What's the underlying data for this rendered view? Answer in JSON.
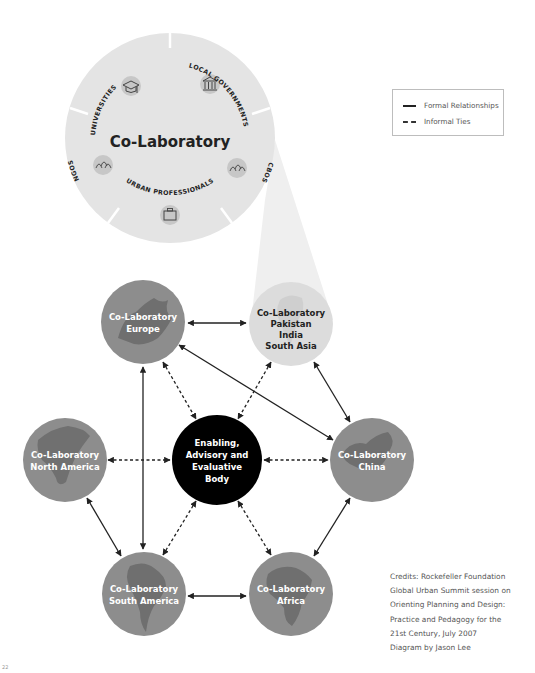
{
  "title": "Co-Laboratory",
  "stakeholders": [
    {
      "label": "UNIVERSITIES",
      "icon": "graduation-cap-icon"
    },
    {
      "label": "LOCAL GOVERNMENTS",
      "icon": "government-building-icon"
    },
    {
      "label": "CBOS",
      "icon": "community-group-icon"
    },
    {
      "label": "URBAN PROFESSIONALS",
      "icon": "briefcase-icon"
    },
    {
      "label": "NGOS",
      "icon": "people-group-icon"
    }
  ],
  "legend": {
    "formal": "Formal Relationships",
    "informal": "Informal Ties"
  },
  "nodes": {
    "europe": {
      "line1": "Co-Laboratory",
      "line2": "Europe"
    },
    "south_asia": {
      "line1": "Co-Laboratory",
      "line2": "Pakistan",
      "line3": "India",
      "line4": "South Asia"
    },
    "north_america": {
      "line1": "Co-Laboratory",
      "line2": "North America"
    },
    "center": {
      "line1": "Enabling,",
      "line2": "Advisory and",
      "line3": "Evaluative",
      "line4": "Body"
    },
    "china": {
      "line1": "Co-Laboratory",
      "line2": "China"
    },
    "south_america": {
      "line1": "Co-Laboratory",
      "line2": "South America"
    },
    "africa": {
      "line1": "Co-Laboratory",
      "line2": "Africa"
    }
  },
  "credits": [
    "Credits: Rockefeller Foundation",
    "Global Urban Summit session on",
    "Orienting Planning and Design:",
    "Practice and Pedagogy for the",
    "21st Century, July 2007",
    "Diagram by Jason Lee"
  ],
  "page_mark": "22",
  "colors": {
    "region_fill": "#8d8d8d",
    "highlight_fill": "#dcdcdc",
    "center_fill": "#000000",
    "big_circle_fill": "#e3e3e3",
    "line": "#222222"
  }
}
